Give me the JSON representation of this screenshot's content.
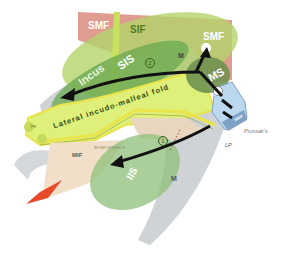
{
  "figure": {
    "labels": {
      "smf_top": "SMF",
      "smf_right": "SMF",
      "sif": "SIF",
      "incus": "Incus",
      "sis": "SIS",
      "ms": "MS",
      "iis": "IIS",
      "lateral_fold": "Lateral incudo-malleal fold",
      "mif": "MIF",
      "m_upper": "M",
      "m_lower": "M",
      "lp": "LP",
      "prussak": "Prussak's",
      "circle_1": "1",
      "circle_2": "2",
      "isthmus": "INTER ISTHMUS",
      "tiny_ms": "LP",
      "smif": "SMIF",
      "pf": "PF"
    },
    "colors": {
      "smf_box": "#d98b7c",
      "sif_green": "#b4d36a",
      "sis_green": "#6aa84f",
      "ms_green": "#6f9150",
      "fold_yellow": "#dff07a",
      "fold_border": "#e8e44a",
      "mif_beige": "#f1dfc9",
      "prussak_blue": "#bcd8ef",
      "bone_gray": "#cfd3d6",
      "arrow_black": "#111111",
      "red_tip": "#e8492b"
    }
  }
}
